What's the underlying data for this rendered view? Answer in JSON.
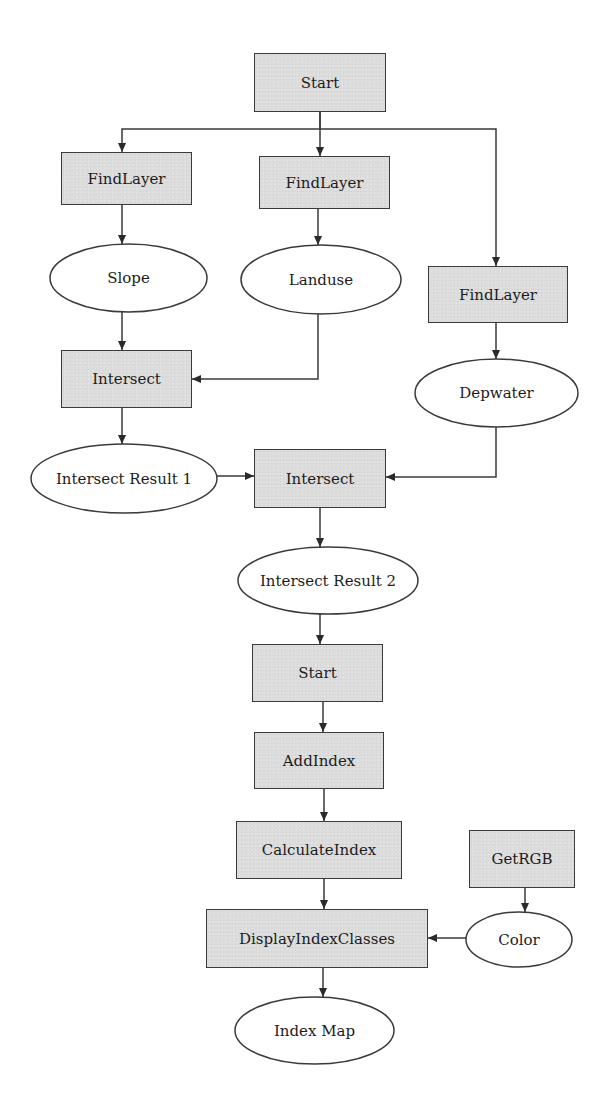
{
  "diagram": {
    "type": "flowchart",
    "colors": {
      "process_fill": "#dcdcdc",
      "stroke": "#3a3a3a",
      "data_fill": "#ffffff",
      "background": "#ffffff"
    },
    "nodes": [
      {
        "id": "start1",
        "label": "Start",
        "shape": "process",
        "x": 254,
        "y": 53,
        "w": 132,
        "h": 59
      },
      {
        "id": "findlayer1",
        "label": "FindLayer",
        "shape": "process",
        "x": 61,
        "y": 152,
        "w": 131,
        "h": 53
      },
      {
        "id": "findlayer2",
        "label": "FindLayer",
        "shape": "process",
        "x": 259,
        "y": 156,
        "w": 131,
        "h": 53
      },
      {
        "id": "findlayer3",
        "label": "FindLayer",
        "shape": "process",
        "x": 428,
        "y": 266,
        "w": 140,
        "h": 57
      },
      {
        "id": "slope",
        "label": "Slope",
        "shape": "data",
        "x": 50,
        "y": 244,
        "w": 157,
        "h": 68
      },
      {
        "id": "landuse",
        "label": "Landuse",
        "shape": "data",
        "x": 241,
        "y": 245,
        "w": 160,
        "h": 69
      },
      {
        "id": "depwater",
        "label": "Depwater",
        "shape": "data",
        "x": 415,
        "y": 359,
        "w": 163,
        "h": 68
      },
      {
        "id": "intersect1",
        "label": "Intersect",
        "shape": "process",
        "x": 61,
        "y": 350,
        "w": 131,
        "h": 58
      },
      {
        "id": "intersect_result1",
        "label": "Intersect Result 1",
        "shape": "data",
        "x": 31,
        "y": 444,
        "w": 186,
        "h": 69
      },
      {
        "id": "intersect2",
        "label": "Intersect",
        "shape": "process",
        "x": 254,
        "y": 449,
        "w": 132,
        "h": 59
      },
      {
        "id": "intersect_result2",
        "label": "Intersect Result 2",
        "shape": "data",
        "x": 238,
        "y": 547,
        "w": 180,
        "h": 67
      },
      {
        "id": "start2",
        "label": "Start",
        "shape": "process",
        "x": 252,
        "y": 644,
        "w": 131,
        "h": 58
      },
      {
        "id": "addindex",
        "label": "AddIndex",
        "shape": "process",
        "x": 254,
        "y": 732,
        "w": 130,
        "h": 57
      },
      {
        "id": "calculateindex",
        "label": "CalculateIndex",
        "shape": "process",
        "x": 236,
        "y": 821,
        "w": 166,
        "h": 58
      },
      {
        "id": "getrgb",
        "label": "GetRGB",
        "shape": "process",
        "x": 469,
        "y": 830,
        "w": 106,
        "h": 58
      },
      {
        "id": "color",
        "label": "Color",
        "shape": "data",
        "x": 466,
        "y": 912,
        "w": 106,
        "h": 55
      },
      {
        "id": "displayindexclasses",
        "label": "DisplayIndexClasses",
        "shape": "process",
        "x": 206,
        "y": 909,
        "w": 222,
        "h": 59
      },
      {
        "id": "indexmap",
        "label": "Index Map",
        "shape": "data",
        "x": 235,
        "y": 997,
        "w": 159,
        "h": 67
      }
    ],
    "edges": [
      {
        "from": "start1",
        "to": "findlayer1",
        "points": [
          [
            320,
            112
          ],
          [
            320,
            129
          ],
          [
            122,
            129
          ],
          [
            122,
            152
          ]
        ]
      },
      {
        "from": "start1",
        "to": "findlayer2",
        "points": [
          [
            320,
            112
          ],
          [
            320,
            156
          ]
        ]
      },
      {
        "from": "start1",
        "to": "findlayer3",
        "points": [
          [
            320,
            129
          ],
          [
            496,
            129
          ],
          [
            496,
            266
          ]
        ]
      },
      {
        "from": "findlayer1",
        "to": "slope",
        "points": [
          [
            122,
            205
          ],
          [
            122,
            244
          ]
        ]
      },
      {
        "from": "findlayer2",
        "to": "landuse",
        "points": [
          [
            318,
            209
          ],
          [
            318,
            245
          ]
        ]
      },
      {
        "from": "findlayer3",
        "to": "depwater",
        "points": [
          [
            496,
            323
          ],
          [
            496,
            359
          ]
        ]
      },
      {
        "from": "slope",
        "to": "intersect1",
        "points": [
          [
            122,
            312
          ],
          [
            122,
            350
          ]
        ]
      },
      {
        "from": "landuse",
        "to": "intersect1",
        "points": [
          [
            318,
            314
          ],
          [
            318,
            379
          ],
          [
            192,
            379
          ]
        ]
      },
      {
        "from": "intersect1",
        "to": "intersect_result1",
        "points": [
          [
            122,
            408
          ],
          [
            122,
            444
          ]
        ]
      },
      {
        "from": "intersect_result1",
        "to": "intersect2",
        "points": [
          [
            217,
            476
          ],
          [
            254,
            476
          ]
        ]
      },
      {
        "from": "depwater",
        "to": "intersect2",
        "points": [
          [
            496,
            427
          ],
          [
            496,
            477
          ],
          [
            386,
            477
          ]
        ]
      },
      {
        "from": "intersect2",
        "to": "intersect_result2",
        "points": [
          [
            320,
            508
          ],
          [
            320,
            547
          ]
        ]
      },
      {
        "from": "intersect_result2",
        "to": "start2",
        "points": [
          [
            320,
            614
          ],
          [
            320,
            644
          ]
        ]
      },
      {
        "from": "start2",
        "to": "addindex",
        "points": [
          [
            323,
            702
          ],
          [
            323,
            732
          ]
        ]
      },
      {
        "from": "addindex",
        "to": "calculateindex",
        "points": [
          [
            324,
            789
          ],
          [
            324,
            821
          ]
        ]
      },
      {
        "from": "calculateindex",
        "to": "displayindexclasses",
        "points": [
          [
            324,
            879
          ],
          [
            324,
            909
          ]
        ]
      },
      {
        "from": "getrgb",
        "to": "color",
        "points": [
          [
            525,
            888
          ],
          [
            525,
            912
          ]
        ]
      },
      {
        "from": "color",
        "to": "displayindexclasses",
        "points": [
          [
            466,
            938
          ],
          [
            428,
            938
          ]
        ]
      },
      {
        "from": "displayindexclasses",
        "to": "indexmap",
        "points": [
          [
            323,
            968
          ],
          [
            323,
            997
          ]
        ]
      }
    ]
  }
}
